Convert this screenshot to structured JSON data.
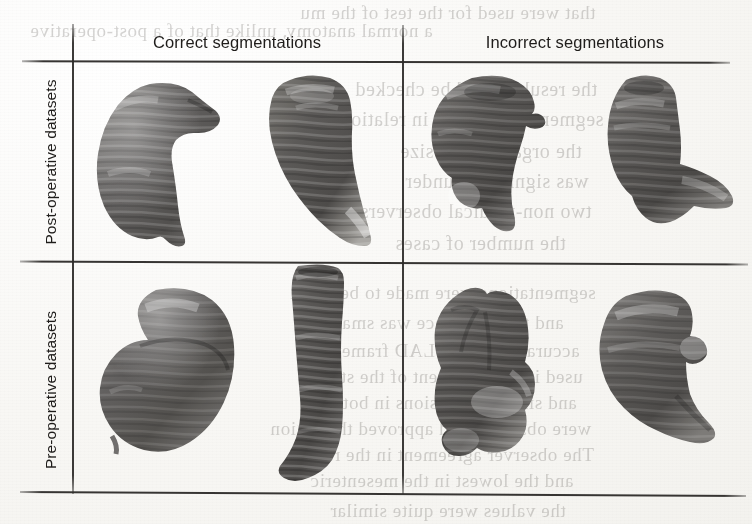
{
  "figure": {
    "kind": "scanned-journal-figure",
    "background_color": "#fbfbf9",
    "rule_color": "#2c2a28"
  },
  "table": {
    "column_headers": [
      {
        "id": "correct",
        "label": "Correct segmentations"
      },
      {
        "id": "incorrect",
        "label": "Incorrect segmentations"
      }
    ],
    "row_headers": [
      {
        "id": "post",
        "label": "Post-operative datasets"
      },
      {
        "id": "pre",
        "label": "Pre-operative datasets"
      }
    ]
  },
  "renderings": [
    {
      "id": "post-correct-1",
      "row": "post",
      "column": "correct",
      "description": "3D surface rendering of a post-operative stomach, rounded pouch with a pointed superior tip and ridged horizontal folds",
      "shade_dark": "#4c4a49",
      "shade_mid": "#6e6c6a",
      "shade_light": "#9b9996"
    },
    {
      "id": "post-correct-2",
      "row": "post",
      "column": "correct",
      "description": "3D surface rendering of a post-operative gastric sleeve, tapering tube curving to the lower right with a pale distal end",
      "shade_dark": "#494746",
      "shade_mid": "#6b6967",
      "shade_light": "#a3a19e"
    },
    {
      "id": "post-incorrect-1",
      "row": "post",
      "column": "incorrect",
      "description": "Incorrect post-operative segmentation, bulbous upper body with a leaked lobe protruding at lower left",
      "shade_dark": "#474544",
      "shade_mid": "#6a6866",
      "shade_light": "#a09e9b"
    },
    {
      "id": "post-incorrect-2",
      "row": "post",
      "column": "incorrect",
      "description": "Incorrect post-operative segmentation, bell-shaped pouch with a broad flat leakage sheet extending to the lower right",
      "shade_dark": "#464443",
      "shade_mid": "#686664",
      "shade_light": "#a5a3a0"
    },
    {
      "id": "pre-correct-1",
      "row": "pre",
      "column": "correct",
      "description": "3D surface rendering of a pre-operative stomach, classic J-shaped body with greater curvature on the right",
      "shade_dark": "#4a4847",
      "shade_mid": "#6d6b69",
      "shade_light": "#9e9c99"
    },
    {
      "id": "pre-correct-2",
      "row": "pre",
      "column": "correct",
      "description": "3D surface rendering of a pre-operative stomach seen edge-on, long narrow curved tube with horizontal rugal banding",
      "shade_dark": "#484645",
      "shade_mid": "#6a6866",
      "shade_light": "#9c9a97"
    },
    {
      "id": "pre-incorrect-1",
      "row": "pre",
      "column": "incorrect",
      "description": "Incorrect pre-operative segmentation, vertically ridged mass with an irregular pale spill at the base",
      "shade_dark": "#474544",
      "shade_mid": "#696765",
      "shade_light": "#a2a09d"
    },
    {
      "id": "pre-incorrect-2",
      "row": "pre",
      "column": "incorrect",
      "description": "Incorrect pre-operative segmentation, broad rounded mass with a notched right edge and a flared lower-right extension",
      "shade_dark": "#484645",
      "shade_mid": "#6b6967",
      "shade_light": "#a6a4a1"
    }
  ],
  "bleed_through": {
    "note": "faint mirrored text showing through from the reverse side of the scanned page",
    "lines": [
      {
        "text": "that were used for the test of the mu",
        "x": 300,
        "y": 2,
        "size": 19
      },
      {
        "text": "a normal anatomy, unlike that of a post-operative",
        "x": 30,
        "y": 20,
        "size": 19
      },
      {
        "text": "the results could be checked",
        "x": 355,
        "y": 78,
        "size": 20
      },
      {
        "text": "segmentation errors in relation",
        "x": 340,
        "y": 108,
        "size": 20
      },
      {
        "text": "the organ and its size",
        "x": 400,
        "y": 140,
        "size": 20
      },
      {
        "text": "was significant under",
        "x": 405,
        "y": 170,
        "size": 20
      },
      {
        "text": "two non-medical observers",
        "x": 360,
        "y": 200,
        "size": 20
      },
      {
        "text": "the number of cases",
        "x": 395,
        "y": 232,
        "size": 20
      },
      {
        "text": "segmentations were made to be much",
        "x": 290,
        "y": 282,
        "size": 19
      },
      {
        "text": "and the difference was small",
        "x": 330,
        "y": 312,
        "size": 19
      },
      {
        "text": "accuracy of the DLAD framework",
        "x": 300,
        "y": 340,
        "size": 19
      },
      {
        "text": "used in every patient of the study",
        "x": 310,
        "y": 366,
        "size": 19
      },
      {
        "text": "and size of the lesions in both of",
        "x": 310,
        "y": 392,
        "size": 19
      },
      {
        "text": "were observed and approved the region",
        "x": 270,
        "y": 418,
        "size": 19
      },
      {
        "text": "The observer agreement in the range",
        "x": 295,
        "y": 444,
        "size": 19
      },
      {
        "text": "and the lowest in the mesenteric",
        "x": 310,
        "y": 470,
        "size": 19
      },
      {
        "text": "the values were quite similar",
        "x": 330,
        "y": 500,
        "size": 19
      }
    ]
  }
}
